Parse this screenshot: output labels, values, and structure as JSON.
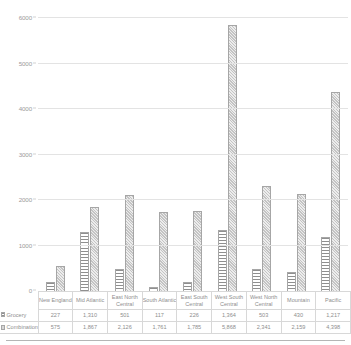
{
  "chart_data": {
    "type": "bar",
    "title": "",
    "xlabel": "",
    "ylabel": "",
    "ylim": [
      0,
      6000
    ],
    "yticks": [
      0,
      1000,
      2000,
      3000,
      4000,
      5000,
      6000
    ],
    "ytick_labels": [
      "0",
      "1000",
      "2000",
      "3000",
      "4000",
      "5000",
      "6000"
    ],
    "grid": true,
    "legend_position": "data-table-row-labels",
    "categories": [
      "New England",
      "Mid Atlantic",
      "East North Central",
      "South Atlantic",
      "East South Central",
      "West South Central",
      "West North Central",
      "Mountain",
      "Pacific"
    ],
    "series": [
      {
        "name": "Grocery",
        "values": [
          227,
          1310,
          501,
          117,
          226,
          1364,
          503,
          430,
          1217
        ],
        "labels": [
          "227",
          "1,310",
          "501",
          "117",
          "226",
          "1,364",
          "503",
          "430",
          "1,217"
        ]
      },
      {
        "name": "Combination",
        "values": [
          575,
          1867,
          2126,
          1761,
          1785,
          5868,
          2341,
          2159,
          4398
        ],
        "labels": [
          "575",
          "1,867",
          "2,126",
          "1,761",
          "1,785",
          "5,868",
          "2,341",
          "2,159",
          "4,398"
        ]
      }
    ]
  },
  "table": {
    "row_labels": [
      "Grocery",
      "Combination"
    ],
    "header_labels": [
      "New England",
      "Mid Atlantic",
      "East North Central",
      "South Atlantic",
      "East South Central",
      "West South Central",
      "West North Central",
      "Mountain",
      "Pacific"
    ]
  },
  "colors": {
    "grocery_fill": "#f2f2f2",
    "grocery_hatch": "#8f8f8f",
    "combination_fill": "#d6d6d6",
    "bar_border": "#a6a6a6",
    "gridline": "#e3e3e3",
    "text": "#8e8e8e"
  }
}
